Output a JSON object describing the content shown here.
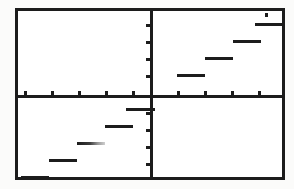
{
  "screen": {
    "device": "graphing-calculator",
    "background_color": "#ffffff",
    "ink_color": "#1c1c1c",
    "frame": {
      "x": 15,
      "y": 8,
      "width": 270,
      "height": 172,
      "border_width": 3
    }
  },
  "chart_data": {
    "type": "line",
    "title": "",
    "subtitle": "",
    "xlabel": "",
    "ylabel": "",
    "plot_style": "step",
    "function": "greatest integer (floor) step function",
    "grid": false,
    "legend": null,
    "axes": {
      "origin_px": {
        "x": 150,
        "y": 95
      },
      "x_axis_y_px": 95,
      "y_axis_x_px": 150,
      "xlim": [
        -5,
        5
      ],
      "ylim": [
        -5,
        5
      ],
      "x_tick_step": 1,
      "y_tick_step": 1,
      "x_tick_spacing_px": 27,
      "y_tick_spacing_px": 17,
      "tick_labels_visible": false
    },
    "x_ticks_px": [
      {
        "x": 24
      },
      {
        "x": 51
      },
      {
        "x": 78
      },
      {
        "x": 105
      },
      {
        "x": 132
      },
      {
        "x": 177
      },
      {
        "x": 204
      },
      {
        "x": 231
      },
      {
        "x": 258
      }
    ],
    "y_ticks_px": [
      {
        "y": 24
      },
      {
        "y": 41
      },
      {
        "y": 58
      },
      {
        "y": 75
      },
      {
        "y": 112
      },
      {
        "y": 129
      },
      {
        "y": 146
      },
      {
        "y": 163
      }
    ],
    "series": [
      {
        "name": "step",
        "segments": [
          {
            "x_start": -5,
            "x_end": -4,
            "y": -5,
            "px": {
              "left": 18,
              "width": 28,
              "top": 173
            },
            "style": "solid"
          },
          {
            "x_start": -4,
            "x_end": -3,
            "y": -4,
            "px": {
              "left": 46,
              "width": 28,
              "top": 156
            },
            "style": "solid"
          },
          {
            "x_start": -3,
            "x_end": -2,
            "y": -3,
            "px": {
              "left": 74,
              "width": 28,
              "top": 139
            },
            "style": "faint"
          },
          {
            "x_start": -2,
            "x_end": -1,
            "y": -2,
            "px": {
              "left": 102,
              "width": 28,
              "top": 122
            },
            "style": "solid"
          },
          {
            "x_start": -1,
            "x_end": 0,
            "y": -1,
            "px": {
              "left": 123,
              "width": 29,
              "top": 105
            },
            "style": "solid"
          },
          {
            "x_start": 1,
            "x_end": 2,
            "y": 1,
            "px": {
              "left": 174,
              "width": 28,
              "top": 71
            },
            "style": "solid"
          },
          {
            "x_start": 2,
            "x_end": 3,
            "y": 2,
            "px": {
              "left": 202,
              "width": 28,
              "top": 54
            },
            "style": "solid"
          },
          {
            "x_start": 3,
            "x_end": 4,
            "y": 3,
            "px": {
              "left": 230,
              "width": 28,
              "top": 37
            },
            "style": "solid"
          },
          {
            "x_start": 4,
            "x_end": 5,
            "y": 4,
            "px": {
              "left": 252,
              "width": 28,
              "top": 20
            },
            "style": "solid"
          }
        ],
        "categories": [
          -5,
          -4,
          -3,
          -2,
          -1,
          1,
          2,
          3,
          4
        ],
        "values": [
          -5,
          -4,
          -3,
          -2,
          -1,
          1,
          2,
          3,
          4
        ]
      }
    ],
    "annotations": [
      {
        "name": "top-right-corner-mark",
        "px": {
          "left": 262,
          "top": 10
        }
      }
    ]
  }
}
